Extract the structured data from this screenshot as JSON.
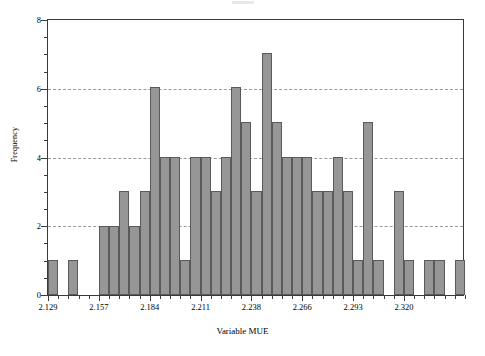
{
  "chart_data": {
    "type": "bar",
    "title": "",
    "xlabel": "Variable MUE",
    "ylabel": "Frequency",
    "ylim": [
      0,
      8
    ],
    "ytick_labels": [
      "0",
      "2",
      "4",
      "6",
      "8"
    ],
    "ytick_values": [
      0,
      2,
      4,
      6,
      8
    ],
    "yminor_step": 0.5,
    "gridlines": [
      2,
      4,
      6
    ],
    "grid": "horizontal-dashed",
    "legend": "none",
    "bin_start": 2.129,
    "bin_width": 0.005486,
    "bin_count": 41,
    "xlim": [
      2.129,
      2.3539
    ],
    "xtick_labels": [
      "2.129",
      "2.157",
      "2.184",
      "2.211",
      "2.238",
      "2.266",
      "2.293",
      "2.320"
    ],
    "xtick_values": [
      2.129,
      2.157,
      2.184,
      2.211,
      2.238,
      2.266,
      2.293,
      2.32
    ],
    "xtick_label_every": 5,
    "categories": [
      "2.129",
      "2.135",
      "2.140",
      "2.146",
      "2.151",
      "2.157",
      "2.162",
      "2.168",
      "2.173",
      "2.179",
      "2.184",
      "2.189",
      "2.195",
      "2.200",
      "2.206",
      "2.211",
      "2.217",
      "2.222",
      "2.228",
      "2.233",
      "2.238",
      "2.244",
      "2.249",
      "2.255",
      "2.260",
      "2.266",
      "2.271",
      "2.277",
      "2.282",
      "2.288",
      "2.293",
      "2.299",
      "2.304",
      "2.310",
      "2.315",
      "2.320",
      "2.326",
      "2.331",
      "2.337",
      "2.342",
      "2.348"
    ],
    "values": [
      1,
      0,
      1,
      0,
      0,
      2,
      2,
      3,
      2,
      3,
      6,
      4,
      4,
      1,
      4,
      4,
      3,
      4,
      6,
      5,
      3,
      7,
      5,
      4,
      4,
      4,
      3,
      3,
      4,
      3,
      1,
      5,
      1,
      0,
      3,
      1,
      0,
      1,
      1,
      0,
      1
    ],
    "total_count": 115,
    "bar_color": "#969696",
    "bar_edge_color": "#5a5a5a",
    "grid_color": "#9a9a9a",
    "axis_color": "#3a3a3a"
  }
}
